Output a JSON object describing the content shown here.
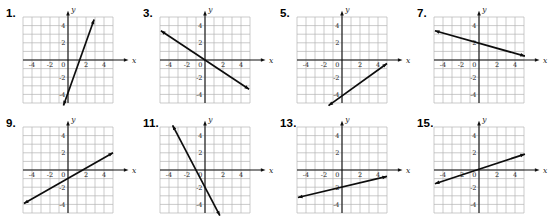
{
  "page": {
    "background": "#ffffff"
  },
  "colors": {
    "grid": "#b5b5b5",
    "axis": "#111111",
    "line": "#0d0d0d",
    "tick_text": "#1a1a1a",
    "number_text": "#000000"
  },
  "chart_data": {
    "shared_axes": {
      "xlabel": "x",
      "ylabel": "y",
      "zero_label": "0",
      "x_range": [
        -5,
        5
      ],
      "y_range": [
        -5,
        5
      ],
      "x_ticks": [
        -4,
        -2,
        2,
        4
      ],
      "y_ticks": [
        4,
        2,
        -2,
        -4
      ],
      "grid": "on",
      "grid_step": 1
    },
    "graphs": [
      {
        "number": "1.",
        "type": "line",
        "slope": 3,
        "y_intercept": -4,
        "endpoints": [
          [
            -0.5,
            -5.3
          ],
          [
            2.9,
            4.7
          ]
        ]
      },
      {
        "number": "3.",
        "type": "line",
        "slope": -0.7,
        "y_intercept": 0,
        "endpoints": [
          [
            -4.9,
            3.4
          ],
          [
            4.9,
            -3.4
          ]
        ]
      },
      {
        "number": "5.",
        "type": "line",
        "slope": 0.75,
        "y_intercept": -4,
        "endpoints": [
          [
            -1.5,
            -5.3
          ],
          [
            5.0,
            -0.4
          ]
        ]
      },
      {
        "number": "7.",
        "type": "line",
        "slope": -0.3,
        "y_intercept": 2,
        "endpoints": [
          [
            -4.9,
            3.4
          ],
          [
            5.1,
            0.45
          ]
        ]
      },
      {
        "number": "9.",
        "type": "line",
        "slope": 0.6,
        "y_intercept": -1,
        "endpoints": [
          [
            -4.9,
            -3.9
          ],
          [
            5.0,
            2.0
          ]
        ]
      },
      {
        "number": "11.",
        "type": "line",
        "slope": -2,
        "y_intercept": -2,
        "endpoints": [
          [
            -3.6,
            5.2
          ],
          [
            1.65,
            -5.3
          ]
        ]
      },
      {
        "number": "13.",
        "type": "line",
        "slope": 0.25,
        "y_intercept": -2,
        "endpoints": [
          [
            -4.9,
            -3.2
          ],
          [
            5.0,
            -0.75
          ]
        ]
      },
      {
        "number": "15.",
        "type": "line",
        "slope": 0.35,
        "y_intercept": 0.1,
        "endpoints": [
          [
            -4.9,
            -1.6
          ],
          [
            5.1,
            1.85
          ]
        ]
      }
    ]
  }
}
